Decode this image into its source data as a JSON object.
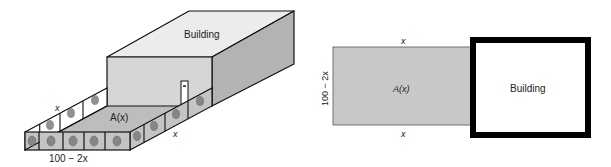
{
  "figure_3d": {
    "building_label": "Building",
    "area_label": "A(x)",
    "side_label_left": "x",
    "side_label_right": "x",
    "front_label": "100 − 2x"
  },
  "figure_plan": {
    "top_label": "x",
    "bottom_label": "x",
    "left_label": "100 − 2x",
    "area_label": "A(x)",
    "building_label": "Building"
  },
  "colors": {
    "ground": "#bdbdbd",
    "building_front": "#d6d6d6",
    "building_top": "#ececec",
    "building_side": "#b3b3b3",
    "fence_panel": "#ffffff",
    "fence_panel_shaded": "#c4c4c4",
    "plan_area": "#c8c8c8",
    "outline": "#111111"
  }
}
